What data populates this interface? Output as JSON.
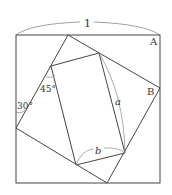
{
  "diagram": {
    "type": "geometry",
    "colors": {
      "stroke": "#444444",
      "arc": "#888888",
      "text": "#333333",
      "background": "#ffffff"
    },
    "labels": {
      "side_length": "1",
      "corner_a": "A",
      "corner_b": "B",
      "angle_30": "30°",
      "angle_45": "45°",
      "length_a": "a",
      "length_b": "b"
    },
    "outer_square": {
      "x": 16,
      "y": 35,
      "width": 144,
      "height": 148
    },
    "rotated_square": [
      [
        68,
        35
      ],
      [
        160,
        88
      ],
      [
        107,
        183
      ],
      [
        16,
        128
      ]
    ],
    "inner_rectangle": [
      [
        51,
        66
      ],
      [
        99,
        53
      ],
      [
        125,
        153
      ],
      [
        76,
        165
      ]
    ]
  }
}
